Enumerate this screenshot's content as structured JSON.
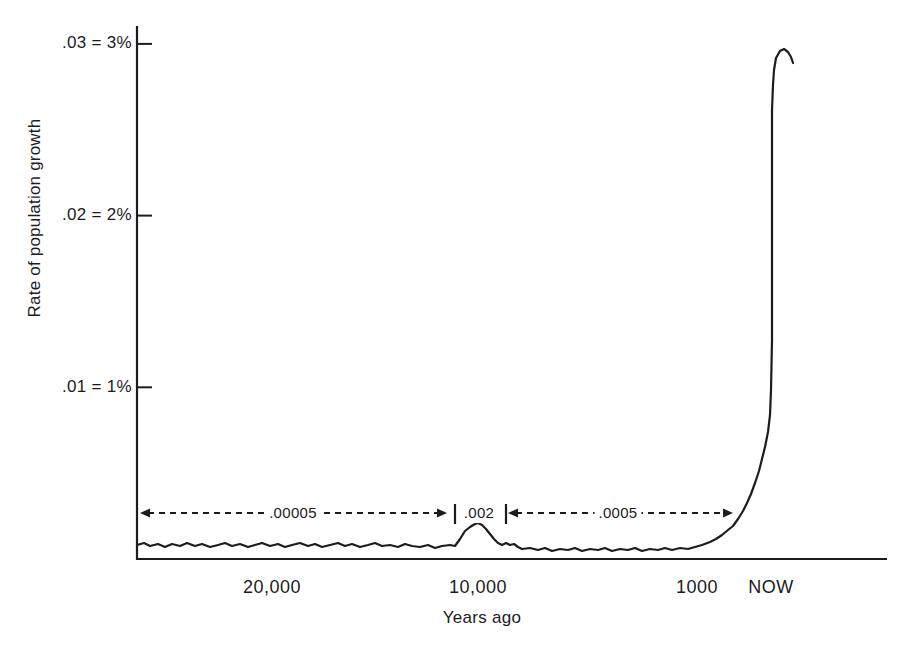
{
  "colors": {
    "ink": "#1c1c1c",
    "background": "#ffffff"
  },
  "chart_data": {
    "type": "line",
    "title": "",
    "ylabel": "Rate of population growth",
    "xlabel": "Years ago",
    "x_axis_style": "schematic (non-linear, hand-drawn book figure)",
    "grid": false,
    "legend": false,
    "y_ticks": [
      {
        "label": ".03 = 3%",
        "pct": 3
      },
      {
        "label": ".02 = 2%",
        "pct": 2
      },
      {
        "label": ".01 = 1%",
        "pct": 1
      }
    ],
    "x_ticks": [
      {
        "label": "20,000",
        "x_px": 272
      },
      {
        "label": "10,000",
        "x_px": 478
      },
      {
        "label": "1000",
        "x_px": 697
      },
      {
        "label": "NOW",
        "x_px": 771
      }
    ],
    "annotations": [
      {
        "label": ".00005",
        "kind": "arrow",
        "x1": 140,
        "x2": 447,
        "y": 513,
        "label_cx": 293
      },
      {
        "label": ".002",
        "kind": "bars",
        "bars": [
          455,
          506
        ],
        "y": 513,
        "label_cx": 479
      },
      {
        "label": ".0005",
        "kind": "arrow",
        "x1": 508,
        "x2": 733,
        "y": 513,
        "label_cx": 618
      }
    ],
    "key_points": [
      {
        "years_ago": "25,000 to ~10,500",
        "rate": 5e-05,
        "rate_pct": 0.005
      },
      {
        "years_ago": "~10,000 (bump)",
        "rate": 0.002,
        "rate_pct": 0.2
      },
      {
        "years_ago": "~9,000 to ~1,000",
        "rate": 0.0005,
        "rate_pct": 0.05
      },
      {
        "years_ago": "NOW (peak of spike)",
        "rate": 0.029,
        "rate_pct": 2.9
      }
    ],
    "polyline_px": [
      [
        137,
        545
      ],
      [
        144,
        543
      ],
      [
        150,
        546
      ],
      [
        158,
        544
      ],
      [
        165,
        547
      ],
      [
        172,
        544
      ],
      [
        180,
        546
      ],
      [
        187,
        543
      ],
      [
        195,
        546
      ],
      [
        202,
        544
      ],
      [
        210,
        547
      ],
      [
        218,
        545
      ],
      [
        225,
        543
      ],
      [
        232,
        546
      ],
      [
        240,
        544
      ],
      [
        248,
        547
      ],
      [
        255,
        545
      ],
      [
        262,
        543
      ],
      [
        270,
        546
      ],
      [
        278,
        544
      ],
      [
        285,
        547
      ],
      [
        292,
        545
      ],
      [
        300,
        543
      ],
      [
        308,
        546
      ],
      [
        315,
        544
      ],
      [
        322,
        547
      ],
      [
        330,
        545
      ],
      [
        338,
        543
      ],
      [
        345,
        546
      ],
      [
        352,
        544
      ],
      [
        360,
        547
      ],
      [
        368,
        545
      ],
      [
        375,
        543
      ],
      [
        382,
        546
      ],
      [
        390,
        545
      ],
      [
        398,
        547
      ],
      [
        405,
        544
      ],
      [
        412,
        546
      ],
      [
        420,
        547
      ],
      [
        428,
        545
      ],
      [
        435,
        548
      ],
      [
        442,
        546
      ],
      [
        450,
        545
      ],
      [
        455,
        546
      ],
      [
        460,
        539
      ],
      [
        465,
        531
      ],
      [
        470,
        527
      ],
      [
        475,
        524
      ],
      [
        478,
        523
      ],
      [
        482,
        525
      ],
      [
        486,
        529
      ],
      [
        490,
        534
      ],
      [
        494,
        539
      ],
      [
        498,
        543
      ],
      [
        502,
        545
      ],
      [
        506,
        543
      ],
      [
        510,
        545
      ],
      [
        514,
        544
      ],
      [
        518,
        547
      ],
      [
        522,
        549
      ],
      [
        530,
        548
      ],
      [
        538,
        550
      ],
      [
        545,
        548
      ],
      [
        552,
        551
      ],
      [
        560,
        549
      ],
      [
        568,
        550
      ],
      [
        575,
        548
      ],
      [
        582,
        551
      ],
      [
        590,
        549
      ],
      [
        598,
        550
      ],
      [
        605,
        548
      ],
      [
        612,
        551
      ],
      [
        620,
        549
      ],
      [
        628,
        550
      ],
      [
        635,
        548
      ],
      [
        642,
        551
      ],
      [
        650,
        549
      ],
      [
        658,
        550
      ],
      [
        665,
        548
      ],
      [
        672,
        550
      ],
      [
        680,
        548
      ],
      [
        688,
        549
      ],
      [
        695,
        547
      ],
      [
        702,
        545
      ],
      [
        710,
        542
      ],
      [
        716,
        539
      ],
      [
        722,
        535
      ],
      [
        728,
        530
      ],
      [
        733,
        526
      ],
      [
        738,
        519
      ],
      [
        743,
        511
      ],
      [
        747,
        503
      ],
      [
        751,
        494
      ],
      [
        755,
        483
      ],
      [
        759,
        471
      ],
      [
        762,
        459
      ],
      [
        765,
        447
      ],
      [
        768,
        432
      ],
      [
        770,
        415
      ],
      [
        771,
        390
      ],
      [
        772,
        340
      ],
      [
        772,
        280
      ],
      [
        772,
        220
      ],
      [
        772,
        160
      ],
      [
        772,
        110
      ],
      [
        773,
        85
      ],
      [
        774,
        70
      ],
      [
        776,
        58
      ],
      [
        780,
        51
      ],
      [
        784,
        49
      ],
      [
        788,
        52
      ],
      [
        791,
        57
      ],
      [
        793,
        63
      ]
    ]
  }
}
